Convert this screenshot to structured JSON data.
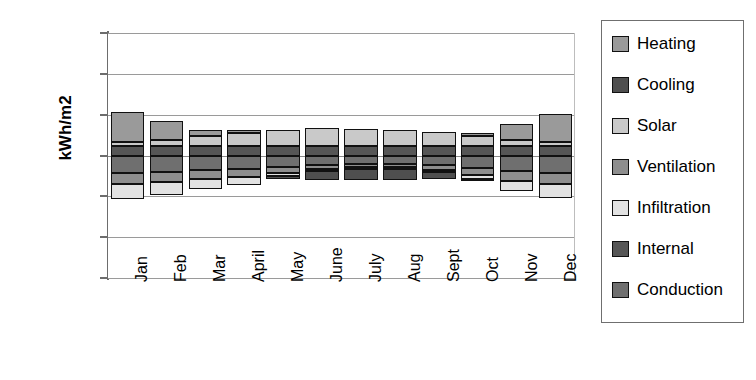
{
  "chart_data": {
    "type": "bar",
    "stacked": true,
    "title": "",
    "xlabel": "",
    "ylabel": "kWh/m2",
    "ylim": [
      -60,
      60
    ],
    "ytick_values": [
      60,
      40,
      20,
      0,
      -20,
      -40,
      -60
    ],
    "ytick_labels": [
      "60",
      "40",
      "20",
      "0",
      "-20",
      "-40",
      "-60"
    ],
    "grid": true,
    "legend_position": "right",
    "categories": [
      "Jan",
      "Feb",
      "Mar",
      "April",
      "May",
      "June",
      "July",
      "Aug",
      "Sept",
      "Oct",
      "Nov",
      "Dec"
    ],
    "series": [
      {
        "name": "Heating",
        "color": "#9a9a9a",
        "values": [
          15.0,
          9.5,
          3.0,
          1.5,
          0.0,
          0.0,
          0.0,
          0.0,
          0.0,
          1.5,
          8.0,
          14.0
        ]
      },
      {
        "name": "Solar",
        "color": "#c9c9c9",
        "values": [
          2.0,
          3.0,
          5.0,
          6.5,
          8.0,
          9.0,
          8.5,
          8.0,
          7.0,
          5.0,
          3.0,
          2.0
        ]
      },
      {
        "name": "Internal",
        "color": "#565656",
        "values": [
          4.5,
          4.5,
          4.5,
          4.5,
          4.5,
          4.5,
          4.5,
          4.5,
          4.5,
          4.5,
          4.5,
          4.5
        ]
      },
      {
        "name": "Conduction",
        "color": "#6f6f6f",
        "values": [
          -8.5,
          -8.0,
          -7.0,
          -6.5,
          -5.5,
          -4.5,
          -4.0,
          -4.0,
          -4.5,
          -6.0,
          -7.5,
          -8.5
        ]
      },
      {
        "name": "Ventilation",
        "color": "#8e8e8e",
        "values": [
          -5.5,
          -5.0,
          -4.5,
          -4.0,
          -3.0,
          -2.0,
          -1.5,
          -1.5,
          -2.5,
          -3.5,
          -5.0,
          -5.5
        ]
      },
      {
        "name": "Infiltration",
        "color": "#e2e2e2",
        "values": [
          -7.5,
          -6.5,
          -5.0,
          -4.0,
          -1.5,
          -1.0,
          -1.0,
          -1.0,
          -1.0,
          -2.0,
          -5.0,
          -7.0
        ]
      },
      {
        "name": "Cooling",
        "color": "#4f4f4f",
        "values": [
          0.0,
          0.0,
          0.0,
          0.0,
          -1.5,
          -4.5,
          -5.5,
          -5.5,
          -3.5,
          -0.5,
          0.0,
          0.0
        ]
      }
    ],
    "stack_order_positive": [
      "Internal",
      "Solar",
      "Heating"
    ],
    "stack_order_negative": [
      "Conduction",
      "Ventilation",
      "Infiltration",
      "Cooling"
    ]
  },
  "legend": {
    "items": [
      {
        "label": "Heating",
        "color": "#9a9a9a"
      },
      {
        "label": "Cooling",
        "color": "#4f4f4f"
      },
      {
        "label": "Solar",
        "color": "#c9c9c9"
      },
      {
        "label": "Ventilation",
        "color": "#8e8e8e"
      },
      {
        "label": "Infiltration",
        "color": "#e2e2e2"
      },
      {
        "label": "Internal",
        "color": "#565656"
      },
      {
        "label": "Conduction",
        "color": "#6f6f6f"
      }
    ]
  },
  "axes": {
    "y_title": "kWh/m2"
  }
}
